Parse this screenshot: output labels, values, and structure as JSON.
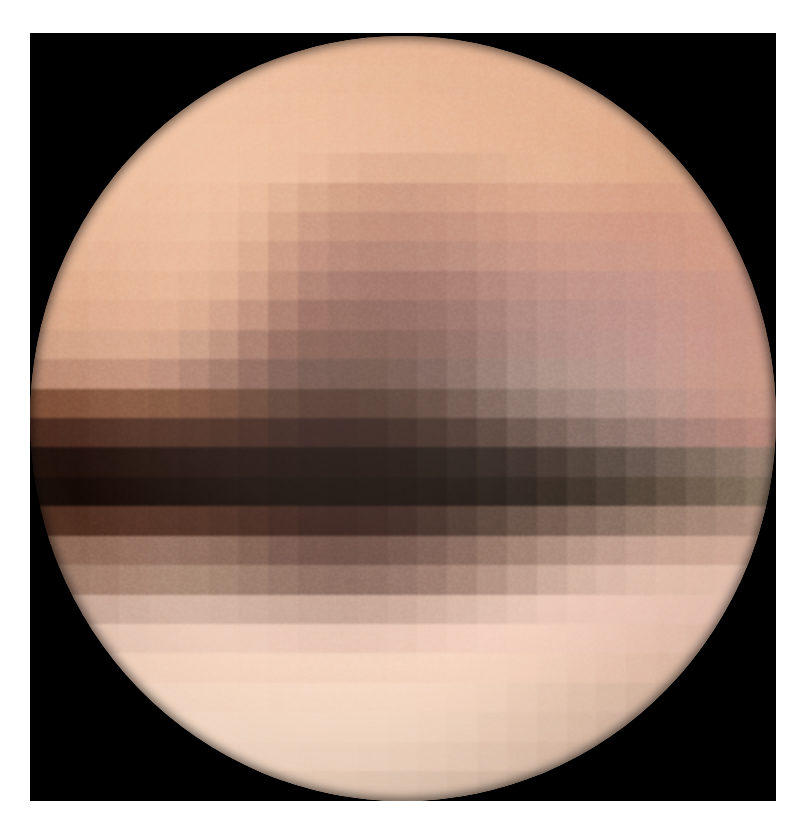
{
  "image": {
    "subject": "Pluto",
    "view_label": "Pluto surface map reconstruction",
    "frame": {
      "background_color": "#ffffff",
      "sky_color": "#000000",
      "sky_left": 30,
      "sky_top": 33,
      "sky_width": 746,
      "sky_height": 768
    },
    "disk": {
      "center_x": 373,
      "center_y": 385,
      "radius_x": 373,
      "radius_y": 382,
      "block_size": 30,
      "grid_cols": 25,
      "grid_rows": 26
    },
    "palette": {
      "bright_polar_cap": "#f7ddc6",
      "bright_spot": "#fdf3e6",
      "light_terrain": "#e9b795",
      "mid_terrain": "#d29b77",
      "tan_terrain": "#c08c6c",
      "dusky_terrain": "#a0826f",
      "grey_terrain": "#8d7b72",
      "dark_terrain": "#6b4533",
      "darker_terrain": "#4a2a1c",
      "very_dark_band": "#2a130b",
      "black_band": "#0c0503",
      "space": "#000000"
    },
    "features": [
      {
        "name": "north-polar-region",
        "description": "Bright uniform salmon cap across top of disk"
      },
      {
        "name": "bright-spot",
        "description": "Very bright white patch on upper right quadrant"
      },
      {
        "name": "mid-latitude-mottling",
        "description": "Patchy grey and tan blocks in the northern mid latitudes"
      },
      {
        "name": "dark-equatorial-band",
        "description": "Broad near-black band spanning the equator"
      },
      {
        "name": "southern-dusky-band",
        "description": "Dark brownish band below the equator"
      },
      {
        "name": "south-polar-cap",
        "description": "Bright cream coloured cap at the bottom of the disk"
      }
    ]
  },
  "chart_data": {
    "type": "heatmap",
    "xlabel": "Longitude (image columns)",
    "ylabel": "Latitude (image rows)",
    "legend": [],
    "grid": false,
    "block_size": 30,
    "cols": 25,
    "rows": 26,
    "colors": [
      [
        "#e8b391",
        "#e8b391",
        "#e9b594",
        "#eab795",
        "#eab795",
        "#eab896",
        "#eab896",
        "#eab896",
        "#e9b795",
        "#e9b694",
        "#e8b593",
        "#e8b492",
        "#e7b392",
        "#e6b291",
        "#e5b190",
        "#e4b08f",
        "#e3af8e",
        "#e2ad8c",
        "#e1ac8b",
        "#e0ab8a",
        "#dfaa89",
        "#dea988",
        "#dda887",
        "#dca786",
        "#dba685"
      ],
      [
        "#e9b694",
        "#eab896",
        "#ebb998",
        "#ecbb9a",
        "#ecbc9b",
        "#edbd9c",
        "#edbd9c",
        "#ecbc9b",
        "#ecbb9a",
        "#ebba99",
        "#eab897",
        "#e9b795",
        "#e8b694",
        "#e7b493",
        "#e6b392",
        "#e5b291",
        "#e4b190",
        "#e3b08f",
        "#e2ae8d",
        "#e1ad8c",
        "#e0ab8a",
        "#dfaa89",
        "#dea988",
        "#dda887",
        "#dca786"
      ],
      [
        "#eab795",
        "#ebb997",
        "#ecbb9a",
        "#edbd9c",
        "#eebe9d",
        "#eebf9e",
        "#eebf9e",
        "#eebe9d",
        "#edbd9c",
        "#ecbc9a",
        "#ebba99",
        "#eab897",
        "#e9b795",
        "#e8b594",
        "#e7b493",
        "#e6b392",
        "#e5b291",
        "#e4b190",
        "#e3b08f",
        "#e2ae8d",
        "#e1ac8b",
        "#e0ab8a",
        "#dfaa89",
        "#dea988",
        "#dda887"
      ],
      [
        "#eab896",
        "#ecba98",
        "#edbc9b",
        "#eebe9d",
        "#efc09f",
        "#efc1a0",
        "#efc0a0",
        "#eebf9e",
        "#edbd9c",
        "#ecbc9b",
        "#ebba99",
        "#eab897",
        "#e9b696",
        "#e8b594",
        "#e7b493",
        "#e6b392",
        "#e5b291",
        "#e4b190",
        "#e3af8e",
        "#e2ad8c",
        "#e0ab8a",
        "#dfaa89",
        "#dea988",
        "#dda887",
        "#dba685"
      ],
      [
        "#e9b795",
        "#ebb997",
        "#edbc9b",
        "#eebe9d",
        "#eec09f",
        "#efc1a0",
        "#eec09f",
        "#edbe9d",
        "#ecbc9b",
        "#e9b897",
        "#e3b191",
        "#dfab8b",
        "#ddaa8a",
        "#dcaa8a",
        "#dcab8b",
        "#dfae8d",
        "#e3b190",
        "#e4b291",
        "#e3b090",
        "#e1ae8d",
        "#dfab8a",
        "#dea988",
        "#dda887",
        "#dca786",
        "#dba584"
      ],
      [
        "#e7b593",
        "#e9b795",
        "#ebba98",
        "#ecbc9b",
        "#edbd9c",
        "#edbe9d",
        "#ecbc9b",
        "#e8b795",
        "#dfae8f",
        "#d6a384",
        "#cf9a7d",
        "#cb957a",
        "#c9937a",
        "#cb957c",
        "#cf997f",
        "#d49e83",
        "#d8a287",
        "#daa58a",
        "#d9a489",
        "#d8a287",
        "#d7a085",
        "#d8a186",
        "#d9a286",
        "#daa285",
        "#d9a184"
      ],
      [
        "#e5b291",
        "#e7b593",
        "#e9b796",
        "#eab998",
        "#ebba99",
        "#eabb9a",
        "#e8b897",
        "#e1b090",
        "#d4a182",
        "#c8927a",
        "#c08a74",
        "#bc8671",
        "#bb8571",
        "#bd8773",
        "#c18b77",
        "#c7917c",
        "#cc9680",
        "#d09a83",
        "#d09a83",
        "#d09984",
        "#d09883",
        "#d29a84",
        "#d59c85",
        "#d79d85",
        "#d89e85"
      ],
      [
        "#e2ae8d",
        "#e4b190",
        "#e6b393",
        "#e8b595",
        "#e9b796",
        "#e7b695",
        "#e3b191",
        "#d8a586",
        "#c7927a",
        "#b98471",
        "#b07d6c",
        "#ac7a6a",
        "#ac7b6b",
        "#af7e6e",
        "#b58474",
        "#bc8a79",
        "#c3907f",
        "#c89482",
        "#ca9785",
        "#cb9786",
        "#cd9987",
        "#d09b88",
        "#d49d88",
        "#d69e88",
        "#d79e87"
      ],
      [
        "#dea989",
        "#e0ac8b",
        "#e2af8e",
        "#e4b190",
        "#e5b291",
        "#e2af8f",
        "#dcaa8b",
        "#cd9a80",
        "#b8856f",
        "#a67666",
        "#9c6e60",
        "#97695d",
        "#97695e",
        "#9b6d62",
        "#a2746a",
        "#ab7d73",
        "#b4867b",
        "#bb8c80",
        "#bf9083",
        "#c19285",
        "#c59488",
        "#c99789",
        "#cd9989",
        "#d09a89",
        "#d19b88"
      ],
      [
        "#d9a485",
        "#dba787",
        "#dea98a",
        "#e0ab8c",
        "#dfab8c",
        "#d9a588",
        "#cd9a81",
        "#ba8872",
        "#a27262",
        "#8f6256",
        "#875d52",
        "#845b51",
        "#865d54",
        "#8b6259",
        "#936a62",
        "#9e756c",
        "#a98078",
        "#b2887f",
        "#b78c83",
        "#bb8f86",
        "#c09289",
        "#c6968b",
        "#cb988b",
        "#ce998a",
        "#cf9a89"
      ],
      [
        "#cf9d81",
        "#d2a084",
        "#d5a387",
        "#d6a488",
        "#d2a186",
        "#c69880",
        "#b78a74",
        "#a07463",
        "#8a5f52",
        "#7b5449",
        "#765046",
        "#745045",
        "#775349",
        "#7e5a51",
        "#88645c",
        "#957169",
        "#a27e76",
        "#ac877f",
        "#b38c84",
        "#b89087",
        "#bf948c",
        "#c6988e",
        "#cb9a8d",
        "#cf9b8c",
        "#d09c8b"
      ],
      [
        "#b9866d",
        "#bc8970",
        "#c08d74",
        "#c08d75",
        "#b88874",
        "#aa7c6b",
        "#9a7060",
        "#876054",
        "#74534a",
        "#674a42",
        "#634740",
        "#63483f",
        "#684d45",
        "#71564f",
        "#7e645c",
        "#8d746b",
        "#9c8178",
        "#a78b81",
        "#af9086",
        "#b59389",
        "#bd978d",
        "#c49a8e",
        "#ca9c8d",
        "#ce9d8c",
        "#d09e8b"
      ],
      [
        "#7a4b33",
        "#7d4e36",
        "#81523a",
        "#82543c",
        "#7d5039",
        "#764b36",
        "#6d4532",
        "#603e2e",
        "#52372b",
        "#482f26",
        "#452d25",
        "#462f26",
        "#4c352c",
        "#563f36",
        "#644d44",
        "#745d54",
        "#846d64",
        "#927a71",
        "#9d837a",
        "#a68a81",
        "#b09086",
        "#b99489",
        "#c2978b",
        "#c99a8b",
        "#cd9c8b"
      ],
      [
        "#46251a",
        "#48271c",
        "#4b2a1f",
        "#4c2c21",
        "#492a1f",
        "#45271d",
        "#40241b",
        "#391f18",
        "#311b16",
        "#2b1714",
        "#291613",
        "#2a1814",
        "#2f1d18",
        "#37251f",
        "#422f28",
        "#503c34",
        "#614c43",
        "#705a51",
        "#7e675e",
        "#8a7168",
        "#957970",
        "#a07f76",
        "#ab847a",
        "#b5897d",
        "#be8d80"
      ],
      [
        "#1c0c07",
        "#1d0d08",
        "#1e0e09",
        "#1f0f0a",
        "#1e0e09",
        "#1c0d08",
        "#1a0c08",
        "#180b07",
        "#150a06",
        "#130906",
        "#120806",
        "#130906",
        "#150b08",
        "#19100c",
        "#1f1612",
        "#281e19",
        "#332822",
        "#40332c",
        "#4d3f37",
        "#5a4b42",
        "#67574e",
        "#746358",
        "#816e62",
        "#8d796b",
        "#988273"
      ],
      [
        "#120704",
        "#130804",
        "#140805",
        "#150905",
        "#140905",
        "#130804",
        "#120804",
        "#110704",
        "#0f0603",
        "#0e0603",
        "#0d0503",
        "#0e0603",
        "#0f0705",
        "#120a07",
        "#170f0b",
        "#1e1610",
        "#261d17",
        "#31261f",
        "#3d3128",
        "#4a3c32",
        "#57483c",
        "#645446",
        "#716051",
        "#7d6c5b",
        "#897765"
      ],
      [
        "#4a291c",
        "#4c2b1e",
        "#4f2e21",
        "#512f23",
        "#4f2e22",
        "#4b2b1f",
        "#46281d",
        "#3f231a",
        "#371e17",
        "#311a15",
        "#2f1914",
        "#311b16",
        "#35201a",
        "#3d2921",
        "#48342b",
        "#554036",
        "#634d42",
        "#71594d",
        "#7e6558",
        "#8a7062",
        "#957a6b",
        "#a08374",
        "#aa8b7b",
        "#b39281",
        "#bb9887"
      ],
      [
        "#8a6453",
        "#8d6756",
        "#916b5a",
        "#946f5e",
        "#93705f",
        "#8f6c5c",
        "#886656",
        "#7e5d4f",
        "#735349",
        "#6b4c43",
        "#684a41",
        "#6a4c43",
        "#705248",
        "#795b50",
        "#85665a",
        "#927365",
        "#a08071",
        "#ad8c7c",
        "#b89686",
        "#c19e8d",
        "#c9a594",
        "#d0ab99",
        "#d5af9d",
        "#d9b2a0",
        "#dcb4a2"
      ],
      [
        "#9c7867",
        "#a07c6a",
        "#a4806e",
        "#a88572",
        "#a98875",
        "#a78773",
        "#a2826f",
        "#9a7a69",
        "#917264",
        "#8b6c5f",
        "#89695d",
        "#8b6b5f",
        "#917165",
        "#9a796c",
        "#a68476",
        "#b39183",
        "#c09e8f",
        "#cdab9a",
        "#d7b5a3",
        "#dfbcab",
        "#e5c2b0",
        "#e9c6b4",
        "#ecc8b6",
        "#eecab8",
        "#efcbb9"
      ],
      [
        "#c5a291",
        "#c9a695",
        "#cdab99",
        "#d1b09e",
        "#d4b3a1",
        "#d4b4a2",
        "#d2b2a0",
        "#cfae9d",
        "#cbaa99",
        "#c8a696",
        "#c7a594",
        "#c9a696",
        "#cdaa9a",
        "#d3b1a0",
        "#dab8a7",
        "#e1bfae",
        "#e7c5b4",
        "#ecc9b8",
        "#efccbb",
        "#f1cdbc",
        "#f2cebd",
        "#f2cdbc",
        "#f1ccbb",
        "#efcab9",
        "#edc8b7"
      ],
      [
        "#e2c1ae",
        "#e5c4b1",
        "#e8c7b4",
        "#ebcab7",
        "#edccb9",
        "#eecdba",
        "#eecdba",
        "#edccb9",
        "#ecc9b7",
        "#eac7b5",
        "#e9c6b4",
        "#eac7b5",
        "#ecc9b7",
        "#efccba",
        "#f2cfbd",
        "#f4d1bf",
        "#f5d2c0",
        "#f5d2c0",
        "#f4d1bf",
        "#f3cfbd",
        "#f1cdbb",
        "#efcab8",
        "#ecc7b5",
        "#e9c4b2",
        "#e6c1af"
      ],
      [
        "#f2d2bd",
        "#f4d4bf",
        "#f5d5c0",
        "#f6d6c1",
        "#f7d7c2",
        "#f7d7c2",
        "#f7d7c2",
        "#f6d6c1",
        "#f5d5c0",
        "#f4d4bf",
        "#f4d4bf",
        "#f4d4bf",
        "#f5d5c0",
        "#f6d6c1",
        "#f7d7c2",
        "#f7d7c2",
        "#f7d6c1",
        "#f5d4bf",
        "#f3d1bc",
        "#f0ceb9",
        "#edcab5",
        "#e9c6b1",
        "#e5c2ad",
        "#e1bea9",
        "#ddbaa5"
      ],
      [
        "#f7dbc6",
        "#f8dcc7",
        "#f9ddc8",
        "#f9ddc8",
        "#f9ddc8",
        "#f9ddc8",
        "#f9ddc8",
        "#f9ddc8",
        "#f8dcc7",
        "#f8dcc7",
        "#f8dcc7",
        "#f8dcc7",
        "#f8dcc7",
        "#f8dbc6",
        "#f7dac5",
        "#f5d8c3",
        "#f2d4bf",
        "#efd0bb",
        "#ebccb7",
        "#e7c8b3",
        "#e3c3ae",
        "#dfbfaa",
        "#dbbba6",
        "#d7b7a2",
        "#d3b39e"
      ],
      [
        "#f8dec9",
        "#f9dfca",
        "#fae0cb",
        "#fae0cb",
        "#fae0cb",
        "#fae0cb",
        "#fae0cb",
        "#f9dfca",
        "#f9dfca",
        "#f9dfca",
        "#f8dec9",
        "#f8dec9",
        "#f7ddc8",
        "#f6dbc6",
        "#f4d9c4",
        "#f1d5c0",
        "#eed1bc",
        "#eacdb8",
        "#e6c8b3",
        "#e1c3ae",
        "#ddbfaa",
        "#d8baa5",
        "#d4b6a1",
        "#d0b29d",
        "#ccae99"
      ],
      [
        "#f6dcc7",
        "#f7ddc8",
        "#f8dec9",
        "#f8dec9",
        "#f8dec9",
        "#f8dec9",
        "#f8dec9",
        "#f7ddc8",
        "#f7ddc8",
        "#f6dcc7",
        "#f6dcc7",
        "#f5dbc6",
        "#f4d9c4",
        "#f2d7c2",
        "#efd4bf",
        "#ecd0bb",
        "#e8ccb7",
        "#e4c7b2",
        "#dfc2ad",
        "#dbbda8",
        "#d6b8a3",
        "#d2b49f",
        "#ceb09b",
        "#caac97",
        "#c6a893"
      ],
      [
        "#f0d5c0",
        "#f1d6c1",
        "#f2d7c2",
        "#f2d7c2",
        "#f2d7c2",
        "#f2d7c2",
        "#f1d6c1",
        "#f1d6c1",
        "#f0d5c0",
        "#efd4bf",
        "#eed3be",
        "#ecd1bc",
        "#ead0bb",
        "#e7cdb8",
        "#e4c9b4",
        "#e0c5b0",
        "#dcc1ac",
        "#d8bda8",
        "#d4b9a4",
        "#d0b5a0",
        "#ccb19c",
        "#c8ad98",
        "#c4a994",
        "#c0a590",
        "#bca18c"
      ]
    ]
  }
}
